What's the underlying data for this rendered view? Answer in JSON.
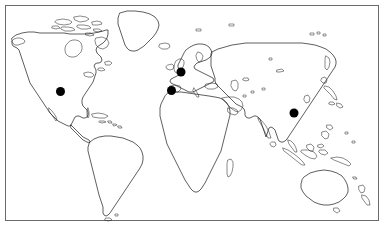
{
  "figure": {
    "type": "world-map",
    "background_color": "#ffffff",
    "frame": {
      "visible": true,
      "color": "#6b6b6b",
      "x": 5,
      "y": 5,
      "width": 374,
      "height": 216
    },
    "projection": "equirectangular",
    "coastline_color": "#1a1a1a"
  },
  "markers": {
    "shape": "filled-circle",
    "color": "#000000",
    "diameter_px": 9,
    "count": 4,
    "items": [
      {
        "id": "marker-north-america",
        "region": "North America",
        "x": 60.5,
        "y": 91.5,
        "r": 4.5
      },
      {
        "id": "marker-northwest-europe",
        "region": "Northwest Europe",
        "x": 181.0,
        "y": 72.0,
        "r": 4.5
      },
      {
        "id": "marker-southwest-europe",
        "region": "Southwest Europe",
        "x": 171.5,
        "y": 90.5,
        "r": 4.5
      },
      {
        "id": "marker-east-asia",
        "region": "East Asia",
        "x": 294.0,
        "y": 113.0,
        "r": 4.5
      }
    ]
  },
  "landmasses": [
    {
      "name": "North America"
    },
    {
      "name": "Greenland"
    },
    {
      "name": "Iceland"
    },
    {
      "name": "Central America"
    },
    {
      "name": "Caribbean Islands"
    },
    {
      "name": "South America"
    },
    {
      "name": "Europe"
    },
    {
      "name": "British Isles"
    },
    {
      "name": "Scandinavia"
    },
    {
      "name": "Africa"
    },
    {
      "name": "Madagascar"
    },
    {
      "name": "Arabian Peninsula"
    },
    {
      "name": "Asia"
    },
    {
      "name": "India"
    },
    {
      "name": "Japan"
    },
    {
      "name": "Southeast Asia"
    },
    {
      "name": "Indonesia"
    },
    {
      "name": "Philippines"
    },
    {
      "name": "Papua New Guinea"
    },
    {
      "name": "Australia"
    },
    {
      "name": "New Zealand"
    },
    {
      "name": "Sri Lanka"
    },
    {
      "name": "Tasmania"
    }
  ],
  "labels": {
    "has_text_labels": false,
    "has_legend": false,
    "has_axes": false,
    "has_gridlines": false
  }
}
